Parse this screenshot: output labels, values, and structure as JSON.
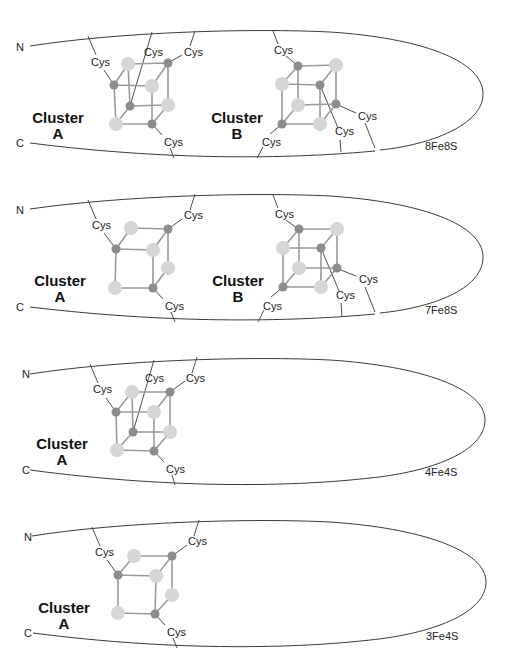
{
  "panels": [
    {
      "id": "8Fe8S",
      "label": "8Fe8S",
      "n_terminus": "N",
      "c_terminus": "C",
      "clusters": [
        {
          "name": "Cluster",
          "letter": "A",
          "fe_count": 4,
          "s_count": 4
        },
        {
          "name": "Cluster",
          "letter": "B",
          "fe_count": 4,
          "s_count": 4
        }
      ],
      "ligand_label": "Cys"
    },
    {
      "id": "7Fe8S",
      "label": "7Fe8S",
      "n_terminus": "N",
      "c_terminus": "C",
      "clusters": [
        {
          "name": "Cluster",
          "letter": "A",
          "fe_count": 3,
          "s_count": 4
        },
        {
          "name": "Cluster",
          "letter": "B",
          "fe_count": 4,
          "s_count": 4
        }
      ],
      "ligand_label": "Cys"
    },
    {
      "id": "4Fe4S",
      "label": "4Fe4S",
      "n_terminus": "N",
      "c_terminus": "C",
      "clusters": [
        {
          "name": "Cluster",
          "letter": "A",
          "fe_count": 4,
          "s_count": 4
        }
      ],
      "ligand_label": "Cys"
    },
    {
      "id": "3Fe4S",
      "label": "3Fe4S",
      "n_terminus": "N",
      "c_terminus": "C",
      "clusters": [
        {
          "name": "Cluster",
          "letter": "A",
          "fe_count": 3,
          "s_count": 4
        }
      ],
      "ligand_label": "Cys"
    }
  ],
  "colors": {
    "iron": "#8c8c8c",
    "sulfur": "#d6d6d6",
    "outline": "#3a3a3a",
    "cube_edge": "#9a9a9a"
  }
}
